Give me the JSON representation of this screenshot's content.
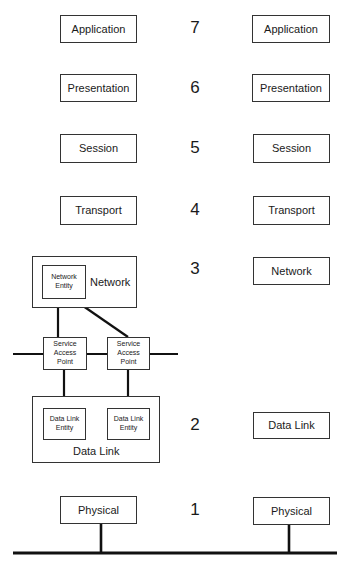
{
  "diagram": {
    "layer_numbers": [
      "7",
      "6",
      "5",
      "4",
      "3",
      "2",
      "1"
    ],
    "left_stack": {
      "application": "Application",
      "presentation": "Presentation",
      "session": "Session",
      "transport": "Transport",
      "network": {
        "label": "Network",
        "entity": "Network Entity"
      },
      "service_access_points": [
        "Service Access Point",
        "Service Access Point"
      ],
      "data_link": {
        "label": "Data Link",
        "entities": [
          "Data Link Entity",
          "Data Link Entity"
        ]
      },
      "physical": "Physical"
    },
    "right_stack": {
      "application": "Application",
      "presentation": "Presentation",
      "session": "Session",
      "transport": "Transport",
      "network": "Network",
      "data_link": "Data Link",
      "physical": "Physical"
    },
    "colors": {
      "line": "#111111",
      "box_border": "#333333",
      "background": "#ffffff"
    }
  }
}
